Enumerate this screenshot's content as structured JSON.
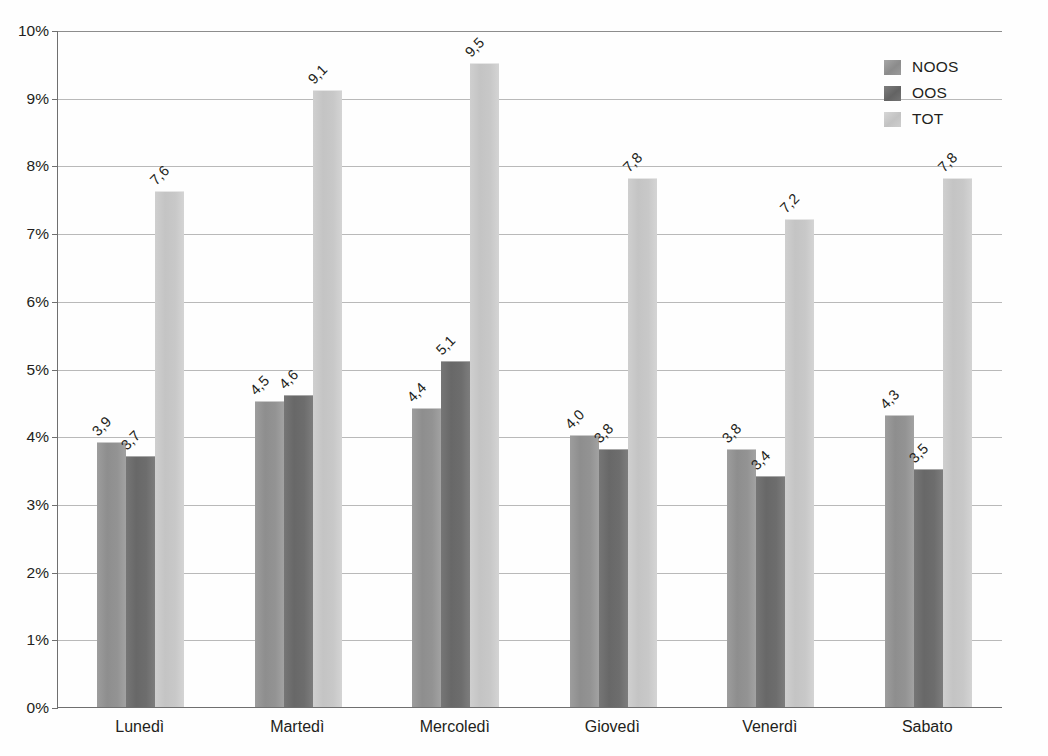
{
  "chart_data": {
    "type": "bar",
    "title": "",
    "subtitle": "",
    "xlabel": "",
    "ylabel": "",
    "categories": [
      "Lunedì",
      "Martedì",
      "Mercoledì",
      "Giovedì",
      "Venerdì",
      "Sabato"
    ],
    "series": [
      {
        "name": "NOOS",
        "color": "#939393",
        "values": [
          3.9,
          4.5,
          4.4,
          4.0,
          3.8,
          4.3
        ],
        "labels": [
          "3,9",
          "4,5",
          "4,4",
          "4,0",
          "3,8",
          "4,3"
        ]
      },
      {
        "name": "OOS",
        "color": "#6d6d6d",
        "values": [
          3.7,
          4.6,
          5.1,
          3.8,
          3.4,
          3.5
        ],
        "labels": [
          "3,7",
          "4,6",
          "5,1",
          "3,8",
          "3,4",
          "3,5"
        ]
      },
      {
        "name": "TOT",
        "color": "#c8c8c8",
        "values": [
          7.6,
          9.1,
          9.5,
          7.8,
          7.2,
          7.8
        ],
        "labels": [
          "7,6",
          "9,1",
          "9,5",
          "7,8",
          "7,2",
          "7,8"
        ]
      }
    ],
    "ylim": [
      0,
      10
    ],
    "ytick_step": 1,
    "ytick_labels": [
      "0%",
      "1%",
      "2%",
      "3%",
      "4%",
      "5%",
      "6%",
      "7%",
      "8%",
      "9%",
      "10%"
    ],
    "ytick_values": [
      0,
      1,
      2,
      3,
      4,
      5,
      6,
      7,
      8,
      9,
      10
    ],
    "grid": true,
    "legend_position": "top-right",
    "value_label_rotation": -45,
    "decimal_separator": ","
  },
  "legend": {
    "items": [
      {
        "label": "NOOS",
        "swatch": "legend-swatch-noos"
      },
      {
        "label": "OOS",
        "swatch": "legend-swatch-oos"
      },
      {
        "label": "TOT",
        "swatch": "legend-swatch-tot"
      }
    ]
  }
}
